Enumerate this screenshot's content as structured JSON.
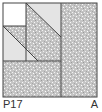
{
  "tile": {
    "code": "P17",
    "mark": "A",
    "colors": {
      "border": "#444444",
      "light_fill": "#e4e4e4",
      "texture_fill": "#c8c8c8",
      "white_fill": "#ffffff"
    }
  }
}
